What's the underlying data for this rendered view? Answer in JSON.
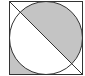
{
  "diagram": {
    "square": {
      "x": 9.5,
      "y": 1.5,
      "size": 73
    },
    "circle": {
      "cx": 46,
      "cy": 38,
      "r": 36.5
    },
    "diagonal": {
      "x1": 9.5,
      "y1": 1.5,
      "x2": 82.5,
      "y2": 74.5
    },
    "colors": {
      "stroke": "#333333",
      "shade": "#c4c4c4",
      "background": "#ffffff"
    },
    "shaded_regions": [
      "circle-upper-right-half",
      "bottom-left-corner"
    ]
  }
}
